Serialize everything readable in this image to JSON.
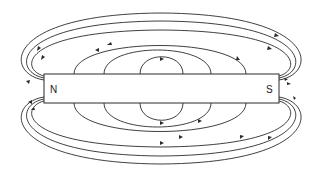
{
  "diagram": {
    "type": "magnetic-field-lines",
    "stroke_color": "#2a2a2a",
    "background": "#ffffff",
    "magnet": {
      "x": 44,
      "y": 74,
      "width": 235,
      "height": 29,
      "north_label": "N",
      "south_label": "S"
    },
    "outer_lines_count": 3,
    "inner_loops_count": 3,
    "arrow_direction": "north-to-south"
  }
}
